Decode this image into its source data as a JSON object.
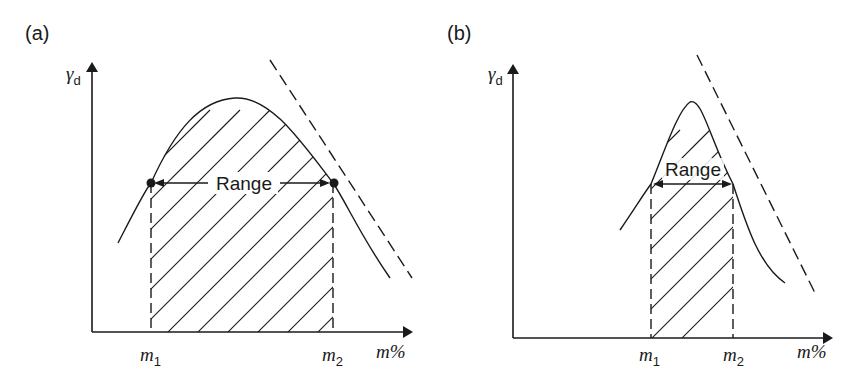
{
  "figure": {
    "panels": [
      {
        "id": "a",
        "label": "(a)",
        "y_axis_label": "γ",
        "y_axis_subscript": "d",
        "x_axis_label": "m%",
        "x_marker_1": "m",
        "x_marker_1_sub": "1",
        "x_marker_2": "m",
        "x_marker_2_sub": "2",
        "range_label": "Range",
        "curve_shape": "broad compaction curve",
        "dashed_line": "zero air voids line"
      },
      {
        "id": "b",
        "label": "(b)",
        "y_axis_label": "γ",
        "y_axis_subscript": "d",
        "x_axis_label": "m%",
        "x_marker_1": "m",
        "x_marker_1_sub": "1",
        "x_marker_2": "m",
        "x_marker_2_sub": "2",
        "range_label": "Range",
        "curve_shape": "narrow peaked compaction curve",
        "dashed_line": "zero air voids line"
      }
    ],
    "colors": {
      "line": "#1a1a1a",
      "background": "#ffffff"
    }
  }
}
